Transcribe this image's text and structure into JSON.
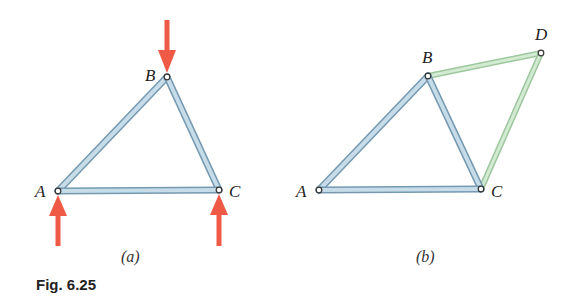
{
  "figure": {
    "caption": "Fig. 6.25",
    "colors": {
      "member_blue": "#a9c9dc",
      "member_blue_edge": "#6f95ad",
      "member_green": "#c4e3c4",
      "member_green_edge": "#93c093",
      "force_arrow": "#ee5a45",
      "pin_fill": "#ffffff",
      "pin_stroke": "#333333"
    },
    "panel_a": {
      "sublabel": "(a)",
      "nodes": {
        "A": {
          "label": "A",
          "x": 58,
          "y": 191
        },
        "B": {
          "label": "B",
          "x": 167,
          "y": 77
        },
        "C": {
          "label": "C",
          "x": 219,
          "y": 190
        }
      },
      "members": [
        [
          "A",
          "B"
        ],
        [
          "B",
          "C"
        ],
        [
          "A",
          "C"
        ]
      ],
      "forces": [
        {
          "at": "B",
          "direction": "down"
        },
        {
          "at": "A",
          "direction": "up"
        },
        {
          "at": "C",
          "direction": "up"
        }
      ]
    },
    "panel_b": {
      "sublabel": "(b)",
      "nodes": {
        "A": {
          "label": "A",
          "x": 319,
          "y": 190
        },
        "B": {
          "label": "B",
          "x": 428,
          "y": 76
        },
        "C": {
          "label": "C",
          "x": 481,
          "y": 189
        },
        "D": {
          "label": "D",
          "x": 541,
          "y": 53
        }
      },
      "members_original": [
        [
          "A",
          "B"
        ],
        [
          "B",
          "C"
        ],
        [
          "A",
          "C"
        ]
      ],
      "members_added": [
        [
          "B",
          "D"
        ],
        [
          "C",
          "D"
        ]
      ]
    }
  }
}
